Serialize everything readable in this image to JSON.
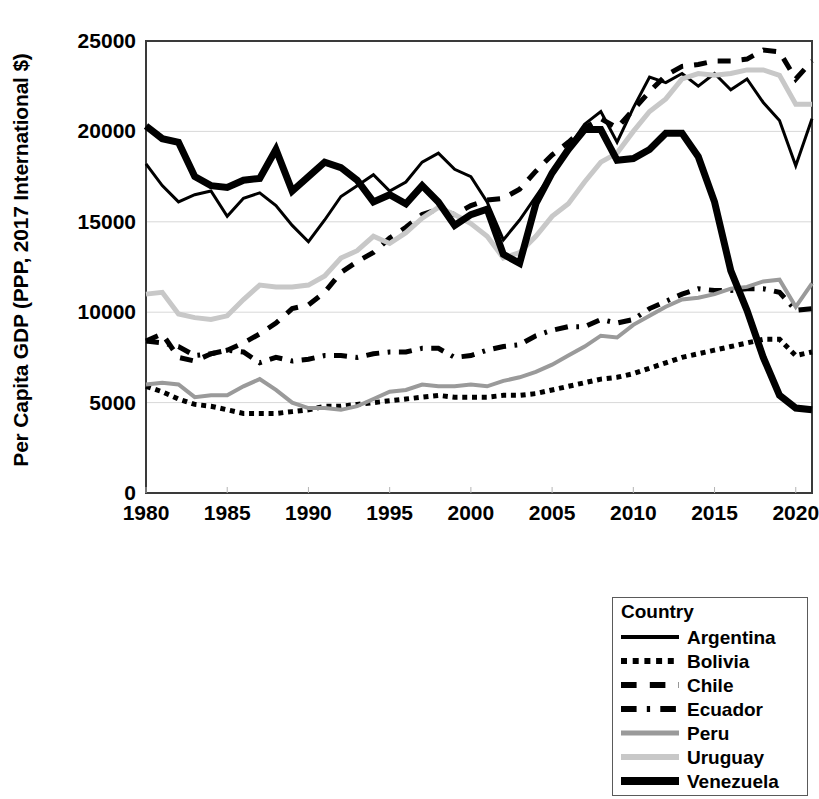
{
  "chart_data": {
    "type": "line",
    "title": "",
    "xlabel": "",
    "ylabel": "Per Capita GDP (PPP, 2017 International $)",
    "xlim": [
      1980,
      2021
    ],
    "ylim": [
      0,
      25000
    ],
    "xticks": [
      1980,
      1985,
      1990,
      1995,
      2000,
      2005,
      2010,
      2015,
      2020
    ],
    "yticks": [
      0,
      5000,
      10000,
      15000,
      20000,
      25000
    ],
    "grid": "horizontal",
    "legend_position": "below-right",
    "legend_title": "Country",
    "x": [
      1980,
      1981,
      1982,
      1983,
      1984,
      1985,
      1986,
      1987,
      1988,
      1989,
      1990,
      1991,
      1992,
      1993,
      1994,
      1995,
      1996,
      1997,
      1998,
      1999,
      2000,
      2001,
      2002,
      2003,
      2004,
      2005,
      2006,
      2007,
      2008,
      2009,
      2010,
      2011,
      2012,
      2013,
      2014,
      2015,
      2016,
      2017,
      2018,
      2019,
      2020,
      2021
    ],
    "series": [
      {
        "name": "Argentina",
        "line_style": "solid",
        "color": "#000000",
        "width": 3,
        "values": [
          18200,
          17000,
          16100,
          16500,
          16700,
          15300,
          16300,
          16600,
          15900,
          14800,
          13900,
          15100,
          16400,
          17000,
          17600,
          16700,
          17200,
          18300,
          18800,
          17900,
          17500,
          16100,
          14000,
          15100,
          16400,
          17700,
          19100,
          20400,
          21100,
          19400,
          21300,
          23000,
          22700,
          23200,
          22500,
          23200,
          22300,
          22900,
          21600,
          20600,
          18100,
          20700
        ]
      },
      {
        "name": "Bolivia",
        "line_style": "dotted",
        "color": "#000000",
        "width": 5,
        "values": [
          5900,
          5600,
          5200,
          4900,
          4800,
          4600,
          4400,
          4400,
          4400,
          4500,
          4600,
          4800,
          4800,
          4900,
          5000,
          5100,
          5200,
          5300,
          5400,
          5300,
          5300,
          5300,
          5400,
          5400,
          5500,
          5700,
          5900,
          6100,
          6300,
          6400,
          6600,
          6900,
          7200,
          7500,
          7700,
          7900,
          8100,
          8300,
          8500,
          8500,
          7600,
          7800
        ]
      },
      {
        "name": "Chile",
        "line_style": "dashed",
        "color": "#000000",
        "width": 5,
        "values": [
          8400,
          8800,
          7500,
          7300,
          7700,
          7900,
          8300,
          8800,
          9400,
          10200,
          10400,
          11100,
          12200,
          12800,
          13300,
          14100,
          14700,
          15400,
          15700,
          15400,
          15900,
          16200,
          16300,
          16800,
          17800,
          18700,
          19400,
          20200,
          20700,
          20200,
          21200,
          22200,
          23100,
          23600,
          23700,
          23900,
          23900,
          24000,
          24500,
          24400,
          22900,
          23900
        ]
      },
      {
        "name": "Ecuador",
        "line_style": "dashdot",
        "color": "#000000",
        "width": 5,
        "values": [
          8400,
          8300,
          8100,
          7600,
          7700,
          7900,
          7800,
          7200,
          7500,
          7300,
          7400,
          7600,
          7600,
          7500,
          7700,
          7800,
          7800,
          8000,
          8000,
          7500,
          7600,
          7900,
          8100,
          8200,
          8700,
          9000,
          9200,
          9200,
          9600,
          9400,
          9600,
          10200,
          10600,
          11000,
          11300,
          11200,
          11200,
          11300,
          11300,
          11100,
          10100,
          10200
        ]
      },
      {
        "name": "Peru",
        "line_style": "solid",
        "color": "#9a9a9a",
        "width": 4,
        "values": [
          6000,
          6100,
          6000,
          5300,
          5400,
          5400,
          5900,
          6300,
          5700,
          5000,
          4700,
          4700,
          4600,
          4800,
          5200,
          5600,
          5700,
          6000,
          5900,
          5900,
          6000,
          5900,
          6200,
          6400,
          6700,
          7100,
          7600,
          8100,
          8700,
          8600,
          9300,
          9800,
          10300,
          10700,
          10800,
          11000,
          11300,
          11400,
          11700,
          11800,
          10300,
          11600
        ]
      },
      {
        "name": "Uruguay",
        "line_style": "solid",
        "color": "#c8c8c8",
        "width": 5,
        "values": [
          11000,
          11100,
          9900,
          9700,
          9600,
          9800,
          10700,
          11500,
          11400,
          11400,
          11500,
          12000,
          13000,
          13400,
          14200,
          13800,
          14400,
          15200,
          15800,
          15400,
          14900,
          14200,
          13000,
          13300,
          14200,
          15300,
          16000,
          17200,
          18300,
          18800,
          20000,
          21100,
          21800,
          22900,
          23200,
          23100,
          23200,
          23400,
          23400,
          23100,
          21500,
          21500
        ]
      },
      {
        "name": "Venezuela",
        "line_style": "solid",
        "color": "#000000",
        "width": 7,
        "values": [
          20300,
          19600,
          19400,
          17500,
          17000,
          16900,
          17300,
          17400,
          19000,
          16700,
          17500,
          18300,
          18000,
          17300,
          16100,
          16500,
          16000,
          17000,
          16100,
          14800,
          15400,
          15700,
          13200,
          12700,
          16000,
          17700,
          19000,
          20100,
          20100,
          18400,
          18500,
          19000,
          19900,
          19900,
          18600,
          16100,
          12300,
          10100,
          7500,
          5400,
          4700,
          4600
        ]
      }
    ]
  },
  "axes": {
    "y_title": "Per Capita GDP (PPP, 2017 International $)",
    "y_tick_labels": [
      "25000",
      "20000",
      "15000",
      "10000",
      "5000",
      "0"
    ],
    "x_tick_labels": [
      "1980",
      "1985",
      "1990",
      "1995",
      "2000",
      "2005",
      "2010",
      "2015",
      "2020"
    ]
  },
  "legend": {
    "title": "Country",
    "entries": [
      {
        "label": "Argentina",
        "style": "solid-black-medium"
      },
      {
        "label": "Bolivia",
        "style": "dotted-black"
      },
      {
        "label": "Chile",
        "style": "dashed-black"
      },
      {
        "label": "Ecuador",
        "style": "dashdot-black"
      },
      {
        "label": "Peru",
        "style": "solid-gray-dark"
      },
      {
        "label": "Uruguay",
        "style": "solid-gray-light"
      },
      {
        "label": "Venezuela",
        "style": "solid-black-thick"
      }
    ]
  }
}
